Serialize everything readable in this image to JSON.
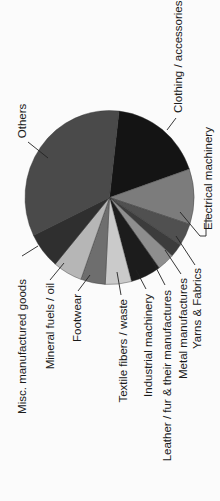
{
  "chart_data": {
    "type": "pie",
    "title": "",
    "orientation_note": "figure rotated 90 degrees counter-clockwise; labels read bottom-to-top",
    "start_angle_deg": 6.5,
    "direction": "clockwise",
    "categories": [
      "Clothing / accessories",
      "Electrical machinery",
      "Yarns & Fabrics",
      "Metal manufactures",
      "Leather / fur & their manufactures",
      "Industrial machinery",
      "Textile fibers / waste",
      "Footwear",
      "Mineral fuels / oil",
      "Misc. manufactured goods",
      "Others"
    ],
    "values": [
      17.9,
      10.3,
      4.2,
      2.5,
      3.3,
      5.8,
      5.0,
      4.7,
      5.6,
      6.7,
      34.0
    ],
    "unit": "%",
    "colors": [
      "#141414",
      "#7c7c7c",
      "#505050",
      "#3c3c3c",
      "#8e8e8e",
      "#1c1c1c",
      "#cacaca",
      "#6e6e6e",
      "#b6b6b6",
      "#2f2f2f",
      "#4a4a4a"
    ],
    "legend": "none (leader-line labels)",
    "grid": false
  },
  "labels": {
    "others": "Others",
    "clothing": "Clothing / accessories",
    "electrical": "Electrical machinery",
    "yarns": "Yarns & Fabrics",
    "metal": "Metal manufactures",
    "leather": "Leather / fur & their manufactures",
    "industrial": "Industrial machinery",
    "textile": "Textile fibers / waste",
    "footwear": "Footwear",
    "mineral": "Mineral fuels / oil",
    "misc": "Misc. manufactured goods"
  }
}
